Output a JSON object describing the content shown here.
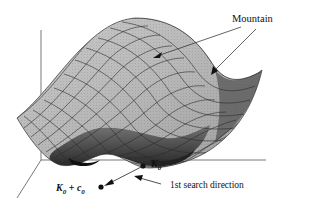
{
  "figure": {
    "type": "3d-surface-diagram",
    "labels": {
      "mountain": "Mountain",
      "k0": "K",
      "k0_sub": "0",
      "k0c0_k": "K",
      "k0c0_sub1": "0",
      "k0c0_plus": " + ",
      "k0c0_c": "c",
      "k0c0_sub2": "0",
      "search_direction": "1st search direction"
    },
    "colors": {
      "surface_light": "#c8c8c8",
      "surface_mid": "#a0a0a0",
      "surface_dark": "#505050",
      "valley": "#111111",
      "grid": "#333333",
      "axis": "#444444",
      "text": "#111111"
    },
    "points": [
      {
        "name": "K0",
        "x": 143,
        "y": 165
      },
      {
        "name": "K0+c0",
        "x": 101,
        "y": 187
      }
    ]
  }
}
